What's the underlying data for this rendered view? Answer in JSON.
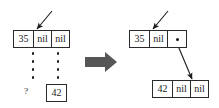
{
  "figure": {
    "background_color": "#ffffff",
    "ink_color": "#1a1a1a",
    "block_arrow_color": "#565656",
    "width": 219,
    "height": 108
  },
  "before": {
    "caption": "before",
    "root_node": {
      "name": "node-35-before",
      "cells": [
        {
          "label": "35",
          "kind": "value"
        },
        {
          "label": "nil",
          "kind": "nil-pointer"
        },
        {
          "label": "nil",
          "kind": "nil-pointer"
        }
      ],
      "incoming_arrow": "incoming-reference-arrow"
    },
    "ellipsis_left": {
      "label": "vertical-dots-left",
      "dot_count": 4
    },
    "ellipsis_right": {
      "label": "vertical-dots-right",
      "dot_count": 4
    },
    "unknown_marker": {
      "label": "?"
    },
    "detached_node": {
      "name": "node-42-detached",
      "cells": [
        {
          "label": "42",
          "kind": "value"
        }
      ]
    }
  },
  "transform": {
    "symbol": "block-arrow-right",
    "direction": "right"
  },
  "after": {
    "caption": "after",
    "root_node": {
      "name": "node-35-after",
      "cells": [
        {
          "label": "35",
          "kind": "value"
        },
        {
          "label": "nil",
          "kind": "nil-pointer"
        },
        {
          "label": "",
          "kind": "pointer-dot"
        }
      ],
      "incoming_arrow": "incoming-reference-arrow"
    },
    "child_node": {
      "name": "node-42-after",
      "cells": [
        {
          "label": "42",
          "kind": "value"
        },
        {
          "label": "nil",
          "kind": "nil-pointer"
        },
        {
          "label": "nil",
          "kind": "nil-pointer"
        }
      ]
    },
    "link": {
      "label": "pointer-link-35-to-42",
      "from": "node-35-after.cell-3",
      "to": "node-42-after"
    }
  }
}
